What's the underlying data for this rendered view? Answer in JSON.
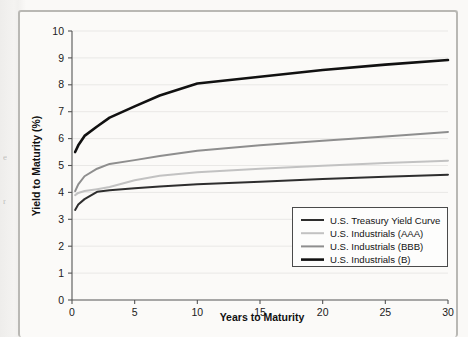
{
  "figure": {
    "background_color": "#fbfaf8",
    "frame_color": "#b9b8b4",
    "page_color": "#f2f1ef",
    "margin_fragments": [
      "e",
      "r"
    ]
  },
  "chart_data": {
    "type": "line",
    "title": "",
    "xlabel": "Years to Maturity",
    "ylabel": "Yield to Maturity (%)",
    "xlim": [
      0,
      30
    ],
    "ylim": [
      0,
      10
    ],
    "xticks": [
      0,
      5,
      10,
      15,
      20,
      25,
      30
    ],
    "yticks": [
      0,
      1,
      2,
      3,
      4,
      5,
      6,
      7,
      8,
      9,
      10
    ],
    "grid": "horizontal",
    "legend_position": "lower right",
    "series": [
      {
        "name": "U.S. Treasury Yield Curve",
        "color": "#2e2e2e",
        "width": 2.0,
        "x": [
          0.25,
          0.5,
          1,
          2,
          3,
          5,
          7,
          10,
          15,
          20,
          25,
          30
        ],
        "y": [
          3.35,
          3.55,
          3.75,
          4.02,
          4.08,
          4.15,
          4.22,
          4.3,
          4.4,
          4.5,
          4.58,
          4.66
        ]
      },
      {
        "name": "U.S. Industrials (AAA)",
        "color": "#c2c2c2",
        "width": 2.0,
        "x": [
          0.25,
          0.5,
          1,
          2,
          3,
          5,
          7,
          10,
          15,
          20,
          25,
          30
        ],
        "y": [
          3.9,
          3.98,
          4.05,
          4.12,
          4.2,
          4.45,
          4.62,
          4.75,
          4.88,
          4.99,
          5.09,
          5.18
        ]
      },
      {
        "name": "U.S. Industrials (BBB)",
        "color": "#8e8e8e",
        "width": 2.0,
        "x": [
          0.25,
          0.5,
          1,
          2,
          3,
          5,
          7,
          10,
          15,
          20,
          25,
          30
        ],
        "y": [
          4.05,
          4.3,
          4.6,
          4.88,
          5.06,
          5.2,
          5.35,
          5.55,
          5.75,
          5.92,
          6.08,
          6.25
        ]
      },
      {
        "name": "U.S. Industrials (B)",
        "color": "#111111",
        "width": 2.6,
        "x": [
          0.25,
          0.5,
          1,
          2,
          3,
          5,
          7,
          10,
          15,
          20,
          25,
          30
        ],
        "y": [
          5.5,
          5.75,
          6.1,
          6.45,
          6.78,
          7.2,
          7.6,
          8.05,
          8.3,
          8.55,
          8.75,
          8.92
        ]
      }
    ]
  }
}
